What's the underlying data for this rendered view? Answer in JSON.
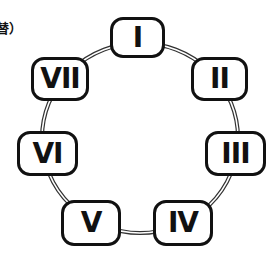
{
  "caption": "替）",
  "diagram": {
    "type": "cycle",
    "connector_style": "double-line",
    "nodes": [
      {
        "id": "I",
        "label": "I"
      },
      {
        "id": "II",
        "label": "II"
      },
      {
        "id": "III",
        "label": "III"
      },
      {
        "id": "IV",
        "label": "IV"
      },
      {
        "id": "V",
        "label": "V"
      },
      {
        "id": "VI",
        "label": "VI"
      },
      {
        "id": "VII",
        "label": "VII"
      }
    ],
    "edges": [
      [
        "I",
        "II"
      ],
      [
        "II",
        "III"
      ],
      [
        "III",
        "IV"
      ],
      [
        "IV",
        "V"
      ],
      [
        "V",
        "VI"
      ],
      [
        "VI",
        "VII"
      ],
      [
        "VII",
        "I"
      ]
    ]
  }
}
